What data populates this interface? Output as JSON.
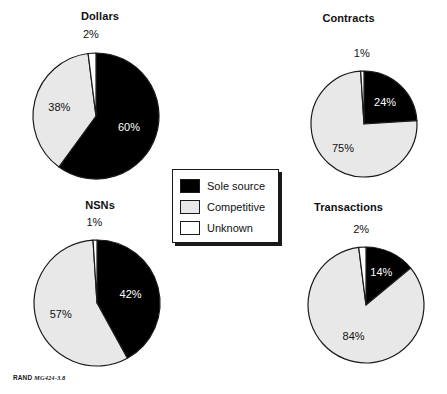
{
  "figure": {
    "footer_brand": "RAND",
    "footer_id": "MG424-3.8"
  },
  "legend": {
    "title": "",
    "items": [
      {
        "label": "Sole source",
        "color": "#000000",
        "swatch": "legend-swatch-sole-source"
      },
      {
        "label": "Competitive",
        "color": "#e8e8e8",
        "swatch": "legend-swatch-competitive"
      },
      {
        "label": "Unknown",
        "color": "#ffffff",
        "swatch": "legend-swatch-unknown"
      }
    ]
  },
  "chart_data": [
    {
      "type": "pie",
      "title": "Dollars",
      "categories": [
        "Sole source",
        "Competitive",
        "Unknown"
      ],
      "values": [
        60,
        38,
        2
      ],
      "labels": [
        "60%",
        "38%",
        "2%"
      ],
      "colors": [
        "#000000",
        "#e8e8e8",
        "#ffffff"
      ],
      "start_angle_deg": 0,
      "direction": "clockwise",
      "units": "percent"
    },
    {
      "type": "pie",
      "title": "Contracts",
      "categories": [
        "Sole source",
        "Competitive",
        "Unknown"
      ],
      "values": [
        24,
        75,
        1
      ],
      "labels": [
        "24%",
        "75%",
        "1%"
      ],
      "colors": [
        "#000000",
        "#e8e8e8",
        "#ffffff"
      ],
      "start_angle_deg": 0,
      "direction": "clockwise",
      "units": "percent"
    },
    {
      "type": "pie",
      "title": "NSNs",
      "categories": [
        "Sole source",
        "Competitive",
        "Unknown"
      ],
      "values": [
        42,
        57,
        1
      ],
      "labels": [
        "42%",
        "57%",
        "1%"
      ],
      "colors": [
        "#000000",
        "#e8e8e8",
        "#ffffff"
      ],
      "start_angle_deg": 0,
      "direction": "clockwise",
      "units": "percent"
    },
    {
      "type": "pie",
      "title": "Transactions",
      "categories": [
        "Sole source",
        "Competitive",
        "Unknown"
      ],
      "values": [
        14,
        84,
        2
      ],
      "labels": [
        "14%",
        "84%",
        "2%"
      ],
      "colors": [
        "#000000",
        "#e8e8e8",
        "#ffffff"
      ],
      "start_angle_deg": 0,
      "direction": "clockwise",
      "units": "percent"
    }
  ],
  "layout": {
    "panels": [
      {
        "key": "dollars",
        "cx": 96,
        "cy": 116,
        "r": 63,
        "title_top": 10,
        "label_offsets": [
          0.55,
          0.6,
          1.3
        ]
      },
      {
        "key": "contracts",
        "cx": 364,
        "cy": 124,
        "r": 53,
        "title_top": 12,
        "label_offsets": [
          0.58,
          0.6,
          1.34
        ]
      },
      {
        "key": "nsns",
        "cx": 97,
        "cy": 303,
        "r": 63,
        "title_top": 199,
        "label_offsets": [
          0.55,
          0.6,
          1.28
        ]
      },
      {
        "key": "transactions",
        "cx": 366,
        "cy": 305,
        "r": 58,
        "title_top": 201,
        "label_offsets": [
          0.62,
          0.58,
          1.32
        ]
      }
    ]
  }
}
